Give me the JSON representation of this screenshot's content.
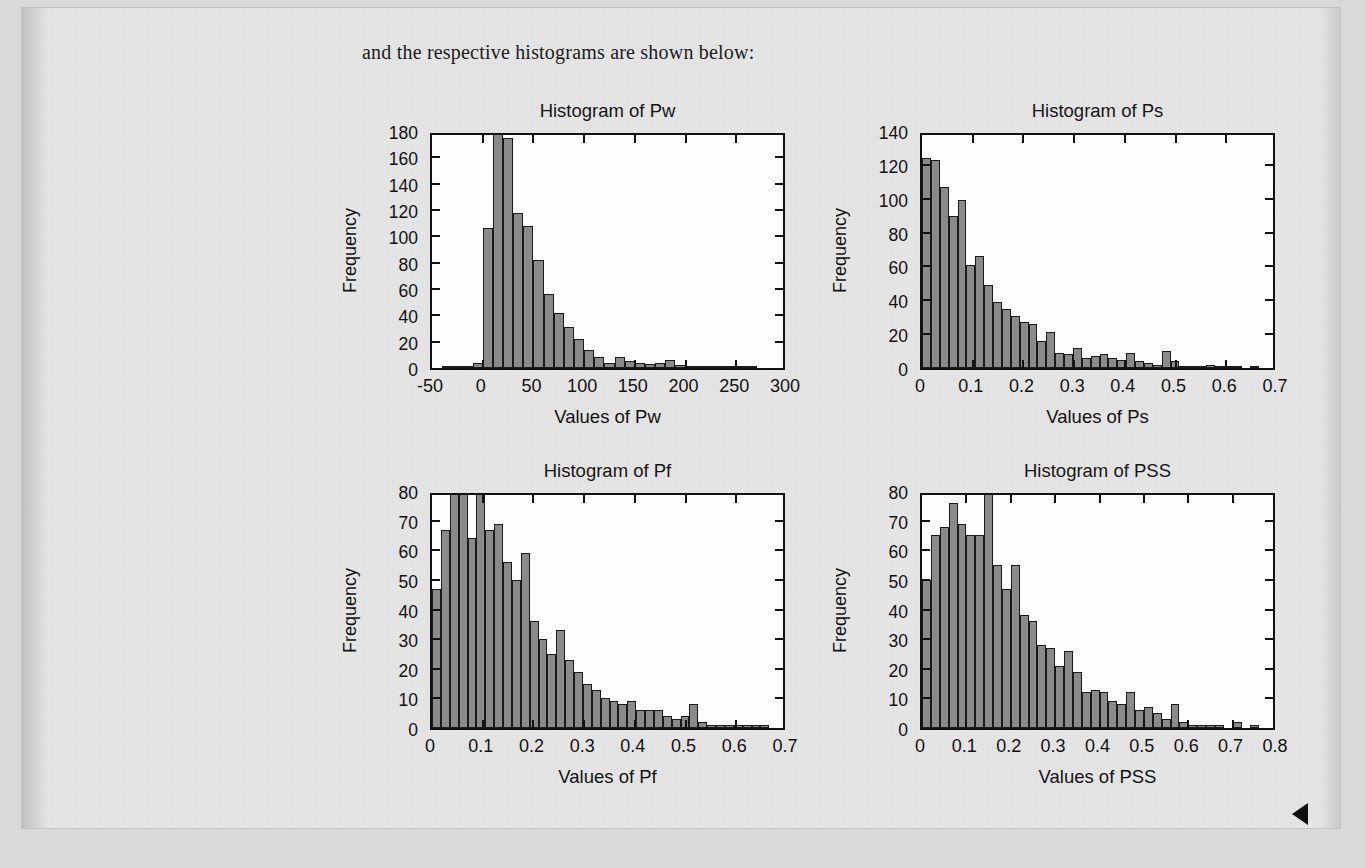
{
  "document": {
    "intro_text": "and the respective histograms are shown below:",
    "page_marker": "left-triangle-marker"
  },
  "theme": {
    "page_background": "#e4e4e4",
    "outer_background": "#d9d9d9",
    "plot_background": "#fdfdfd",
    "bar_fill": "#8a8a8a",
    "bar_edge": "#1a1a1a",
    "axis_color": "#111111",
    "text_color": "#161616"
  },
  "chart_data": [
    {
      "id": "pw",
      "type": "bar",
      "title": "Histogram of Pw",
      "xlabel": "Values of Pw",
      "ylabel": "Frequency",
      "xlim": [
        -50,
        300
      ],
      "ylim": [
        0,
        180
      ],
      "xticks": [
        -50,
        0,
        50,
        100,
        150,
        200,
        250,
        300
      ],
      "xticklabels": [
        "-50",
        "0",
        "50",
        "100",
        "150",
        "200",
        "250",
        "300"
      ],
      "yticks": [
        0,
        20,
        40,
        60,
        80,
        100,
        120,
        140,
        160,
        180
      ],
      "yticklabels": [
        "0",
        "20",
        "40",
        "60",
        "80",
        "100",
        "120",
        "140",
        "160",
        "180"
      ],
      "grid": false,
      "bin_width": 10,
      "bin_starts": [
        -40,
        -30,
        -20,
        -10,
        0,
        10,
        20,
        30,
        40,
        50,
        60,
        70,
        80,
        90,
        100,
        110,
        120,
        130,
        140,
        150,
        160,
        170,
        180,
        190,
        200,
        210,
        220,
        230,
        240,
        250,
        260,
        270,
        280,
        290
      ],
      "values": [
        1,
        1,
        1,
        4,
        106,
        180,
        175,
        118,
        108,
        82,
        56,
        42,
        31,
        22,
        14,
        8,
        4,
        8,
        5,
        4,
        3,
        4,
        6,
        2,
        1,
        1,
        1,
        1,
        1,
        1,
        1,
        0,
        0,
        0
      ]
    },
    {
      "id": "ps",
      "type": "bar",
      "title": "Histogram of Ps",
      "xlabel": "Values of Ps",
      "ylabel": "Frequency",
      "xlim": [
        0,
        0.7
      ],
      "ylim": [
        0,
        140
      ],
      "xticks": [
        0,
        0.1,
        0.2,
        0.3,
        0.4,
        0.5,
        0.6,
        0.7
      ],
      "xticklabels": [
        "0",
        "0.1",
        "0.2",
        "0.3",
        "0.4",
        "0.5",
        "0.6",
        "0.7"
      ],
      "yticks": [
        0,
        20,
        40,
        60,
        80,
        100,
        120,
        140
      ],
      "yticklabels": [
        "0",
        "20",
        "40",
        "60",
        "80",
        "100",
        "120",
        "140"
      ],
      "grid": false,
      "bin_width": 0.0175,
      "bin_starts": [
        0,
        0.0175,
        0.035,
        0.0525,
        0.07,
        0.0875,
        0.105,
        0.1225,
        0.14,
        0.1575,
        0.175,
        0.1925,
        0.21,
        0.2275,
        0.245,
        0.2625,
        0.28,
        0.2975,
        0.315,
        0.3325,
        0.35,
        0.3675,
        0.385,
        0.4025,
        0.42,
        0.4375,
        0.455,
        0.4725,
        0.49,
        0.5075,
        0.525,
        0.5425,
        0.56,
        0.5775,
        0.595,
        0.6125,
        0.63,
        0.6475
      ],
      "values": [
        124,
        123,
        107,
        90,
        99,
        61,
        66,
        49,
        39,
        35,
        31,
        27,
        26,
        16,
        21,
        9,
        8,
        12,
        6,
        7,
        8,
        6,
        5,
        9,
        4,
        3,
        2,
        10,
        4,
        1,
        1,
        1,
        2,
        1,
        1,
        1,
        0,
        1
      ]
    },
    {
      "id": "pf",
      "type": "bar",
      "title": "Histogram of Pf",
      "xlabel": "Values of Pf",
      "ylabel": "Frequency",
      "xlim": [
        0,
        0.7
      ],
      "ylim": [
        0,
        80
      ],
      "xticks": [
        0,
        0.1,
        0.2,
        0.3,
        0.4,
        0.5,
        0.6,
        0.7
      ],
      "xticklabels": [
        "0",
        "0.1",
        "0.2",
        "0.3",
        "0.4",
        "0.5",
        "0.6",
        "0.7"
      ],
      "yticks": [
        0,
        10,
        20,
        30,
        40,
        50,
        60,
        70,
        80
      ],
      "yticklabels": [
        "0",
        "10",
        "20",
        "30",
        "40",
        "50",
        "60",
        "70",
        "80"
      ],
      "grid": false,
      "bin_width": 0.0175,
      "bin_starts": [
        0,
        0.0175,
        0.035,
        0.0525,
        0.07,
        0.0875,
        0.105,
        0.1225,
        0.14,
        0.1575,
        0.175,
        0.1925,
        0.21,
        0.2275,
        0.245,
        0.2625,
        0.28,
        0.2975,
        0.315,
        0.3325,
        0.35,
        0.3675,
        0.385,
        0.4025,
        0.42,
        0.4375,
        0.455,
        0.4725,
        0.49,
        0.5075,
        0.525,
        0.5425,
        0.56,
        0.5775,
        0.595,
        0.6125,
        0.63,
        0.6475
      ],
      "values": [
        47,
        67,
        79,
        82,
        64,
        80,
        67,
        69,
        56,
        50,
        59,
        36,
        30,
        25,
        33,
        23,
        19,
        15,
        13,
        10,
        9,
        8,
        9,
        6,
        6,
        6,
        4,
        3,
        4,
        8,
        2,
        1,
        1,
        1,
        1,
        1,
        1,
        1
      ]
    },
    {
      "id": "pss",
      "type": "bar",
      "title": "Histogram of PSS",
      "xlabel": "Values of PSS",
      "ylabel": "Frequency",
      "xlim": [
        0,
        0.8
      ],
      "ylim": [
        0,
        80
      ],
      "xticks": [
        0,
        0.1,
        0.2,
        0.3,
        0.4,
        0.5,
        0.6,
        0.7,
        0.8
      ],
      "xticklabels": [
        "0",
        "0.1",
        "0.2",
        "0.3",
        "0.4",
        "0.5",
        "0.6",
        "0.7",
        "0.8"
      ],
      "yticks": [
        0,
        10,
        20,
        30,
        40,
        50,
        60,
        70,
        80
      ],
      "yticklabels": [
        "0",
        "10",
        "20",
        "30",
        "40",
        "50",
        "60",
        "70",
        "80"
      ],
      "grid": false,
      "bin_width": 0.02,
      "bin_starts": [
        0,
        0.02,
        0.04,
        0.06,
        0.08,
        0.1,
        0.12,
        0.14,
        0.16,
        0.18,
        0.2,
        0.22,
        0.24,
        0.26,
        0.28,
        0.3,
        0.32,
        0.34,
        0.36,
        0.38,
        0.4,
        0.42,
        0.44,
        0.46,
        0.48,
        0.5,
        0.52,
        0.54,
        0.56,
        0.58,
        0.6,
        0.62,
        0.64,
        0.66,
        0.68,
        0.7,
        0.72,
        0.74,
        0.76,
        0.78
      ],
      "values": [
        50,
        65,
        68,
        76,
        69,
        65,
        65,
        80,
        55,
        47,
        55,
        38,
        36,
        28,
        27,
        21,
        26,
        19,
        12,
        13,
        12,
        9,
        8,
        12,
        6,
        7,
        5,
        3,
        8,
        2,
        1,
        1,
        1,
        1,
        0,
        2,
        0,
        1,
        0,
        0
      ]
    }
  ]
}
